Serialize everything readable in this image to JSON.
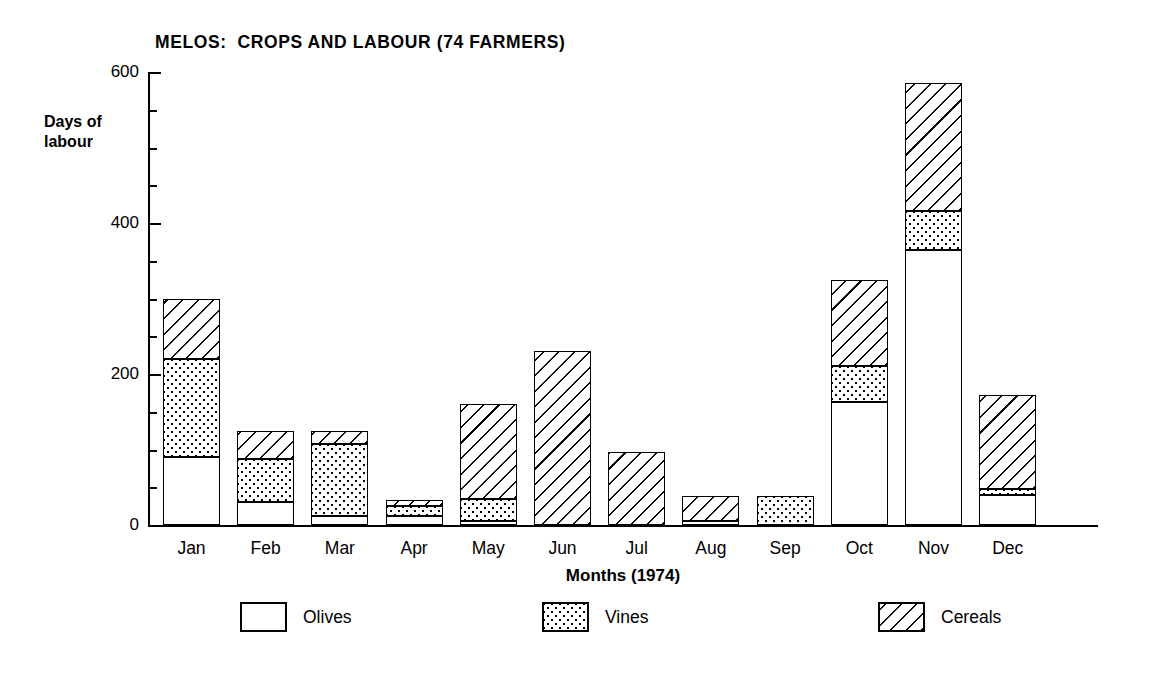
{
  "chart_data": {
    "type": "bar",
    "subtype": "stacked-bar",
    "title": "MELOS:  CROPS AND LABOUR (74 FARMERS)",
    "xlabel": "Months (1974)",
    "ylabel": "Days of\nlabour",
    "categories": [
      "Jan",
      "Feb",
      "Mar",
      "Apr",
      "May",
      "Jun",
      "Jul",
      "Aug",
      "Sep",
      "Oct",
      "Nov",
      "Dec"
    ],
    "series": [
      {
        "name": "Olives",
        "pattern": "blank",
        "values": [
          90,
          30,
          12,
          12,
          5,
          0,
          0,
          5,
          0,
          163,
          364,
          40
        ]
      },
      {
        "name": "Vines",
        "pattern": "dotted",
        "values": [
          130,
          58,
          95,
          13,
          30,
          0,
          0,
          0,
          38,
          47,
          52,
          8
        ]
      },
      {
        "name": "Cereals",
        "pattern": "hatched",
        "values": [
          80,
          37,
          18,
          8,
          125,
          230,
          97,
          33,
          0,
          115,
          169,
          124
        ]
      }
    ],
    "totals": [
      300,
      125,
      125,
      33,
      160,
      230,
      97,
      38,
      38,
      325,
      585,
      172
    ],
    "ylim": [
      0,
      600
    ],
    "yticks_major": [
      0,
      200,
      400,
      600
    ],
    "yticks_major_labels": [
      "0",
      "200",
      "400",
      "600"
    ],
    "yticks_minor_step": 50,
    "grid": false,
    "legend_position": "bottom"
  },
  "legend": {
    "items": [
      {
        "label": "Olives",
        "pattern": "blank"
      },
      {
        "label": "Vines",
        "pattern": "dotted"
      },
      {
        "label": "Cereals",
        "pattern": "hatched"
      }
    ]
  }
}
